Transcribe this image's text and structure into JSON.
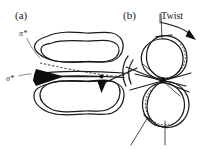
{
  "figure": {
    "background_color": "#ffffff",
    "ink_color": "#1a1a1a",
    "width_px": 211,
    "height_px": 149
  },
  "panel_a": {
    "label": "(a)",
    "labels": {
      "pi_star": "π*",
      "sigma_star": "σ*"
    },
    "annotations": {
      "pi_star_leader": "leader-line-to-upper-lobe",
      "sigma_star_leader": "leader-line-to-left-arrowhead",
      "double_arrow": "horizontal-double-headed-arrow-between-lobes"
    },
    "description": "Two stacked wavy stadium-shaped loops drawn as double outlines, joined across the middle by a horizontal double-headed arrow with filled triangular heads; a dashed line runs diagonally across the mid-plane indicating a hidden edge."
  },
  "panel_b": {
    "label": "(b)",
    "labels": {
      "twist": "Twist"
    },
    "annotations": {
      "twist_arrow": "curved-arrow-indicating-rotation",
      "crossing_node": "central-crossing-point",
      "dashed_edges": "hidden-back-segments-of-loops",
      "radiating_lines": "straight-tangent-lines-through-node"
    },
    "description": "A figure-eight writhed loop: an upper circular lobe and a lower circular lobe meeting at a central crossing node, with dashed back arcs, straight tangent lines radiating through the node, and a curved Twist arrow at the top."
  },
  "icons": {
    "arrowhead": "solid-triangle-arrowhead",
    "curved_arrow": "curved-rotation-arrow"
  }
}
